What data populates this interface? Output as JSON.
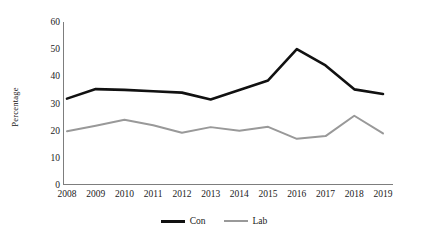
{
  "chart_data": {
    "type": "line",
    "title": "",
    "xlabel": "",
    "ylabel": "Percentage",
    "categories": [
      "2008",
      "2009",
      "2010",
      "2011",
      "2012",
      "2013",
      "2014",
      "2015",
      "2016",
      "2017",
      "2018",
      "2019"
    ],
    "series": [
      {
        "name": "Con",
        "color": "#111111",
        "values": [
          31.8,
          35.3,
          35.0,
          34.5,
          34.0,
          31.5,
          35.0,
          38.5,
          50.0,
          44.0,
          35.2,
          33.5
        ]
      },
      {
        "name": "Lab",
        "color": "#999999",
        "values": [
          19.8,
          21.8,
          24.0,
          22.0,
          19.2,
          21.3,
          20.0,
          21.4,
          17.0,
          18.0,
          25.5,
          19.0
        ]
      }
    ],
    "ylim": [
      0,
      60
    ],
    "yticks": [
      60,
      50,
      40,
      30,
      20,
      10,
      0
    ],
    "grid": false,
    "legend_position": "bottom"
  },
  "legend": {
    "items": [
      {
        "label": "Con",
        "color": "#111111"
      },
      {
        "label": "Lab",
        "color": "#999999"
      }
    ]
  },
  "axis": {
    "line_color": "#7d7d7d"
  }
}
